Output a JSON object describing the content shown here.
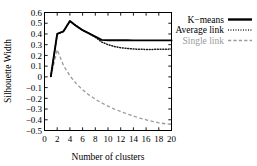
{
  "chart_data": {
    "type": "line",
    "title": "",
    "xlabel": "Number of clusters",
    "ylabel": "Silhouette Width",
    "xlim": [
      0,
      20
    ],
    "ylim": [
      -0.5,
      0.6
    ],
    "grid": false,
    "legend_position": "right-top",
    "xticks": [
      "0",
      "2",
      "4",
      "6",
      "8",
      "10",
      "12",
      "14",
      "16",
      "18",
      "20"
    ],
    "xtick_values": [
      0,
      2,
      4,
      6,
      8,
      10,
      12,
      14,
      16,
      18,
      20
    ],
    "yticks": [
      "0.6",
      "0.5",
      "0.4",
      "0.3",
      "0.2",
      "0.1",
      "0",
      "−0.1",
      "−0.2",
      "−0.3",
      "−0.4",
      "−0.5"
    ],
    "ytick_values": [
      0.6,
      0.5,
      0.4,
      0.3,
      0.2,
      0.1,
      0,
      -0.1,
      -0.2,
      -0.3,
      -0.4,
      -0.5
    ],
    "x": [
      1,
      2,
      3,
      4,
      5,
      6,
      7,
      8,
      9,
      10,
      11,
      12,
      13,
      14,
      15,
      16,
      17,
      18,
      19,
      20
    ],
    "series": [
      {
        "name": "K−means",
        "style": "solid",
        "color": "#000000",
        "values": [
          0.005,
          0.4,
          0.425,
          0.52,
          0.475,
          0.435,
          0.405,
          0.375,
          0.345,
          0.342,
          0.341,
          0.341,
          0.341,
          0.34,
          0.34,
          0.34,
          0.34,
          0.34,
          0.34,
          0.34
        ]
      },
      {
        "name": "Average link",
        "style": "dotted",
        "color": "#1a1a1a",
        "values": [
          0.005,
          0.4,
          0.425,
          0.52,
          0.475,
          0.435,
          0.405,
          0.37,
          0.325,
          0.3,
          0.283,
          0.272,
          0.265,
          0.26,
          0.257,
          0.256,
          0.256,
          0.257,
          0.258,
          0.259
        ]
      },
      {
        "name": "Single link",
        "style": "dashed",
        "color": "#9a9a9a",
        "values": [
          0.005,
          0.253,
          0.105,
          0.01,
          -0.063,
          -0.12,
          -0.168,
          -0.208,
          -0.243,
          -0.273,
          -0.3,
          -0.323,
          -0.345,
          -0.365,
          -0.385,
          -0.4,
          -0.415,
          -0.428,
          -0.437,
          -0.442
        ]
      }
    ],
    "legend": [
      {
        "label": "K−means",
        "style": "solid",
        "muted": false
      },
      {
        "label": "Average link",
        "style": "dotted",
        "muted": false
      },
      {
        "label": "Single link",
        "style": "dashed",
        "muted": true
      }
    ]
  }
}
